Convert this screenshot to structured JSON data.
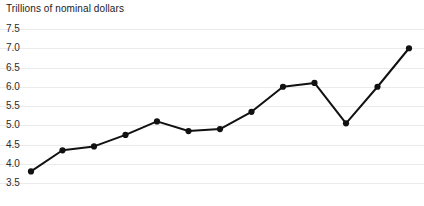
{
  "chart_data": {
    "type": "line",
    "title": "Trillions of nominal dollars",
    "xlabel": "",
    "ylabel": "",
    "ylim": [
      3.5,
      7.5
    ],
    "yticks": [
      3.5,
      4.0,
      4.5,
      5.0,
      5.5,
      6.0,
      6.5,
      7.0,
      7.5
    ],
    "ytick_labels": [
      "3.5",
      "4.0",
      "4.5",
      "5.0",
      "5.5",
      "6.0",
      "6.5",
      "7.0",
      "7.5"
    ],
    "grid": true,
    "legend": "none",
    "x": [
      1,
      2,
      3,
      4,
      5,
      6,
      7,
      8,
      9,
      10,
      11,
      12,
      13
    ],
    "values": [
      3.8,
      4.35,
      4.45,
      4.75,
      5.1,
      4.85,
      4.9,
      5.35,
      6.0,
      6.1,
      5.05,
      6.0,
      7.0
    ],
    "series": [
      {
        "name": "Trillions of nominal dollars",
        "color": "#111111",
        "values": [
          3.8,
          4.35,
          4.45,
          4.75,
          5.1,
          4.85,
          4.9,
          5.35,
          6.0,
          6.1,
          5.05,
          6.0,
          7.0
        ]
      }
    ],
    "marker": "circle",
    "marker_color": "#111111",
    "line_color": "#111111",
    "grid_color": "#ebebeb",
    "background": "#ffffff"
  }
}
